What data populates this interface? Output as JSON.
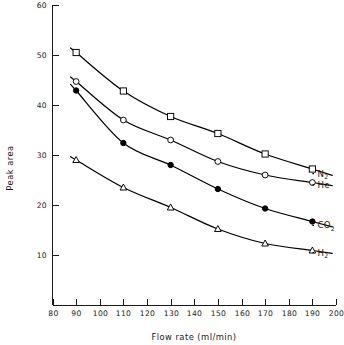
{
  "chart_data": {
    "type": "line",
    "title": "",
    "xlabel": "Flow rate (ml/min)",
    "ylabel": "Peak area",
    "xlim": [
      80,
      200
    ],
    "ylim": [
      0,
      60
    ],
    "grid": false,
    "legend_position": "right-inline-end-of-curve",
    "x_ticks": [
      80,
      90,
      100,
      110,
      120,
      130,
      140,
      150,
      160,
      170,
      180,
      190,
      200
    ],
    "x_tick_labels": [
      "80",
      "90",
      "100",
      "110",
      "120",
      "130",
      "140",
      "150",
      "160",
      "170",
      "180",
      "190",
      "200"
    ],
    "y_ticks": [
      10,
      20,
      30,
      40,
      50,
      60
    ],
    "y_tick_labels": [
      "10",
      "20",
      "30",
      "40",
      "50",
      "60"
    ],
    "x": [
      90,
      110,
      130,
      150,
      170,
      190
    ],
    "series": [
      {
        "name": "N2",
        "label_main": "N",
        "label_sub": "2",
        "marker": "open-square",
        "values": [
          50.5,
          42.8,
          37.7,
          34.3,
          30.2,
          27.2
        ]
      },
      {
        "name": "He",
        "label_main": "He",
        "label_sub": "",
        "marker": "open-circle",
        "values": [
          44.7,
          37.0,
          33.0,
          28.7,
          26.0,
          24.5
        ]
      },
      {
        "name": "CO2",
        "label_main": "CO",
        "label_sub": "2",
        "marker": "filled-circle",
        "values": [
          42.9,
          32.4,
          28.0,
          23.2,
          19.3,
          16.7
        ]
      },
      {
        "name": "H2",
        "label_main": "H",
        "label_sub": "2",
        "marker": "open-triangle",
        "values": [
          29.0,
          23.5,
          19.5,
          15.2,
          12.3,
          10.9
        ]
      }
    ]
  },
  "axes": {
    "x_title": "Flow rate (ml/min)",
    "y_title": "Peak area"
  },
  "colors": {
    "ink": "#000000",
    "background": "#ffffff"
  }
}
